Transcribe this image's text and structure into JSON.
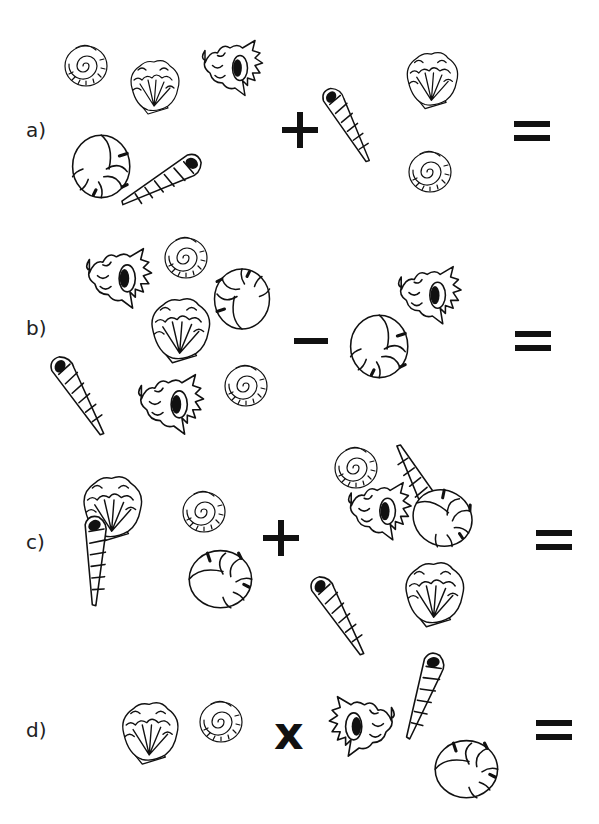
{
  "worksheet": {
    "problems": [
      {
        "label": "a)",
        "operator": "+",
        "left_group": [
          "spiral-snail-shell",
          "scallop-shell",
          "conch-shell",
          "nautilus-shell",
          "auger-shell"
        ],
        "right_group": [
          "auger-shell",
          "scallop-shell",
          "spiral-snail-shell"
        ],
        "equals": "="
      },
      {
        "label": "b)",
        "operator": "−",
        "left_group": [
          "conch-shell",
          "spiral-snail-shell",
          "nautilus-shell",
          "scallop-shell",
          "auger-shell",
          "conch-shell",
          "spiral-snail-shell"
        ],
        "right_group": [
          "nautilus-shell",
          "conch-shell"
        ],
        "equals": "="
      },
      {
        "label": "c)",
        "operator": "+",
        "left_group": [
          "scallop-shell",
          "spiral-snail-shell",
          "auger-shell",
          "nautilus-shell"
        ],
        "right_group": [
          "spiral-snail-shell",
          "auger-shell",
          "conch-shell",
          "nautilus-shell",
          "auger-shell",
          "scallop-shell"
        ],
        "equals": "="
      },
      {
        "label": "d)",
        "operator": "x",
        "left_group": [
          "scallop-shell",
          "spiral-snail-shell"
        ],
        "right_group": [
          "conch-shell",
          "auger-shell",
          "nautilus-shell"
        ],
        "equals": "="
      }
    ]
  }
}
